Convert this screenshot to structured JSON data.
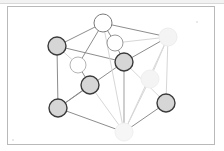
{
  "document": {
    "title": "Face-centred cubic unit cell diagram",
    "caption": "",
    "background_color": "#ffffff",
    "frame": {
      "visible": true,
      "border_color": "#b9b9b9",
      "x": 7,
      "y": 6,
      "width": 208,
      "height": 139
    },
    "scan_artifacts": {
      "top_edge_visible": true,
      "top_edge_color": "#f2f2f2",
      "specks": [
        {
          "x": 196,
          "y": 21
        },
        {
          "x": 12,
          "y": 139
        }
      ]
    }
  },
  "figure": {
    "type": "crystal-lattice-unit-cell",
    "lattice": "face-centred cubic",
    "edge_color": "#8d8d8d",
    "edge_color_faded": "#d7d7d7",
    "edge_width": 1,
    "node_stroke_color": "#3a3a3a",
    "node_stroke_color_faded": "#e6e6e6",
    "node_fill_grey": "#d6d6d6",
    "node_fill_white": "#ffffff",
    "node_fill_ghost": "#f4f4f4",
    "node_radius": 9,
    "node_radius_small": 8,
    "nodes": [
      {
        "id": "corner-top-back",
        "label": "top back corner atom",
        "x": 103,
        "y": 23,
        "r": 9,
        "fill": "#ffffff",
        "stroke": "#7a7a7a",
        "style": "outline"
      },
      {
        "id": "corner-left-upper",
        "label": "upper left corner atom",
        "x": 57,
        "y": 46,
        "r": 9,
        "fill": "#d6d6d6",
        "stroke": "#3a3a3a",
        "style": "filled"
      },
      {
        "id": "corner-right-upper",
        "label": "upper right corner atom",
        "x": 168,
        "y": 37,
        "r": 9,
        "fill": "#f4f4f4",
        "stroke": "#ededed",
        "style": "ghost"
      },
      {
        "id": "face-top",
        "label": "top face-centre atom",
        "x": 115,
        "y": 43,
        "r": 8,
        "fill": "#ffffff",
        "stroke": "#9a9a9a",
        "style": "outline"
      },
      {
        "id": "face-left",
        "label": "left face-centre atom",
        "x": 78,
        "y": 65,
        "r": 8,
        "fill": "#ffffff",
        "stroke": "#b4b4b4",
        "style": "outline"
      },
      {
        "id": "face-back",
        "label": "back face-centre atom",
        "x": 124,
        "y": 62,
        "r": 9,
        "fill": "#d6d6d6",
        "stroke": "#3a3a3a",
        "style": "filled"
      },
      {
        "id": "face-front",
        "label": "front face-centre atom",
        "x": 90,
        "y": 85,
        "r": 9,
        "fill": "#d6d6d6",
        "stroke": "#3a3a3a",
        "style": "filled"
      },
      {
        "id": "face-right",
        "label": "right face-centre atom",
        "x": 150,
        "y": 79,
        "r": 9,
        "fill": "#f4f4f4",
        "stroke": "#efefef",
        "style": "ghost"
      },
      {
        "id": "corner-left-lower",
        "label": "lower left corner atom",
        "x": 58,
        "y": 108,
        "r": 9,
        "fill": "#d6d6d6",
        "stroke": "#3a3a3a",
        "style": "filled"
      },
      {
        "id": "corner-right-lower",
        "label": "lower right corner atom",
        "x": 166,
        "y": 103,
        "r": 9,
        "fill": "#d6d6d6",
        "stroke": "#3a3a3a",
        "style": "filled"
      },
      {
        "id": "corner-bottom-front",
        "label": "bottom front corner atom",
        "x": 124,
        "y": 132,
        "r": 9,
        "fill": "#f6f6f6",
        "stroke": "#f0f0f0",
        "style": "ghost"
      }
    ],
    "edges": [
      {
        "from": "corner-left-upper",
        "to": "corner-top-back",
        "faded": false
      },
      {
        "from": "corner-top-back",
        "to": "corner-right-upper",
        "faded": false
      },
      {
        "from": "corner-left-upper",
        "to": "corner-left-lower",
        "faded": false
      },
      {
        "from": "corner-right-upper",
        "to": "corner-right-lower",
        "faded": true
      },
      {
        "from": "corner-left-lower",
        "to": "corner-bottom-front",
        "faded": false
      },
      {
        "from": "corner-bottom-front",
        "to": "corner-right-lower",
        "faded": false
      },
      {
        "from": "corner-left-upper",
        "to": "face-back",
        "faded": false
      },
      {
        "from": "face-back",
        "to": "corner-right-upper",
        "faded": false
      },
      {
        "from": "corner-left-lower",
        "to": "face-back",
        "faded": false
      },
      {
        "from": "face-back",
        "to": "corner-bottom-front",
        "faded": false
      },
      {
        "from": "corner-top-back",
        "to": "face-left",
        "faded": false
      },
      {
        "from": "corner-top-back",
        "to": "face-top",
        "faded": false
      },
      {
        "from": "face-top",
        "to": "face-back",
        "faded": false
      },
      {
        "from": "face-left",
        "to": "face-front",
        "faded": false
      },
      {
        "from": "face-front",
        "to": "corner-left-lower",
        "faded": false
      },
      {
        "from": "face-front",
        "to": "corner-bottom-front",
        "faded": true
      },
      {
        "from": "corner-right-upper",
        "to": "face-right",
        "faded": true
      },
      {
        "from": "face-right",
        "to": "corner-bottom-front",
        "faded": true
      },
      {
        "from": "corner-right-upper",
        "to": "corner-bottom-front",
        "faded": true
      },
      {
        "from": "corner-top-back",
        "to": "corner-bottom-front",
        "faded": true
      },
      {
        "from": "corner-left-upper",
        "to": "face-left",
        "faded": true
      },
      {
        "from": "face-top",
        "to": "corner-right-upper",
        "faded": true
      },
      {
        "from": "corner-right-lower",
        "to": "face-back",
        "faded": true
      },
      {
        "from": "corner-bottom-front",
        "to": "face-back",
        "faded": true
      }
    ]
  }
}
